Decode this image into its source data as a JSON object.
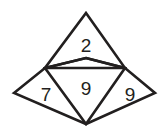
{
  "figure": {
    "title": "Overlapping polygons puzzle figure",
    "canvas": {
      "width": 166,
      "height": 131,
      "background": "#ffffff"
    },
    "style": {
      "stroke_color": "#221f1f",
      "stroke_width": 2.6,
      "label_color": "#231f20",
      "label_font_size": 19
    },
    "vertices": {
      "top_apex": {
        "x": 86,
        "y": 13
      },
      "upper_left": {
        "x": 45,
        "y": 68
      },
      "upper_right": {
        "x": 125,
        "y": 68
      },
      "mid_top": {
        "x": 86,
        "y": 58
      },
      "far_left": {
        "x": 14,
        "y": 93
      },
      "far_right": {
        "x": 155,
        "y": 93
      },
      "bottom_apex": {
        "x": 86,
        "y": 124
      }
    },
    "shapes": [
      {
        "name": "upper-triangle",
        "points": "86,13 125,68 86,58 45,68",
        "closed": true
      },
      {
        "name": "center-diamond",
        "points": "86,58 125,68 86,124 45,68",
        "closed": true
      },
      {
        "name": "wide-rhombus",
        "points": "14,93 45,68 125,68 155,93 86,124",
        "closed": true
      }
    ],
    "labels": [
      {
        "name": "label-2",
        "text": "2",
        "x": 86,
        "y": 45
      },
      {
        "name": "label-9-center",
        "text": "9",
        "x": 86,
        "y": 88
      },
      {
        "name": "label-7-left",
        "text": "7",
        "x": 46,
        "y": 94
      },
      {
        "name": "label-9-right",
        "text": "9",
        "x": 130,
        "y": 94
      }
    ]
  },
  "chart_data": {
    "type": "diagram",
    "regions": [
      {
        "label": "2",
        "shape": "upper triangle",
        "position": "top"
      },
      {
        "label": "9",
        "shape": "center diamond",
        "position": "center"
      },
      {
        "label": "7",
        "shape": "left wing of wide rhombus",
        "position": "left"
      },
      {
        "label": "9",
        "shape": "right wing of wide rhombus",
        "position": "right"
      }
    ],
    "values": [
      2,
      9,
      7,
      9
    ],
    "categories": [
      "top",
      "center",
      "left",
      "right"
    ]
  }
}
